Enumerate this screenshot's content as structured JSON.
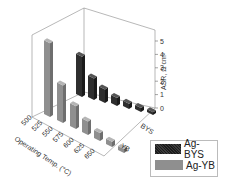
{
  "chart_data": {
    "type": "bar",
    "subtype": "3d-bar",
    "title": "",
    "xlabel": "Operating Temp. (°C)",
    "ylabel": "",
    "zlabel": "ASR, Ω cm²",
    "categories": [
      "500",
      "525",
      "550",
      "575",
      "600",
      "625",
      "650"
    ],
    "depth_categories": [
      "BYS",
      "YB"
    ],
    "zticks": [
      "0",
      "1",
      "2",
      "3",
      "4",
      "5"
    ],
    "zlim": [
      0,
      5.5
    ],
    "series": [
      {
        "name": "Ag-BYS",
        "color": "#2a2a2a",
        "values": [
          3.0,
          1.6,
          1.0,
          0.6,
          0.4,
          0.3,
          0.2
        ]
      },
      {
        "name": "Ag-YB",
        "color": "#8f8f8f",
        "values": [
          5.5,
          2.8,
          1.7,
          1.0,
          0.6,
          0.4,
          0.3
        ]
      }
    ],
    "legend": {
      "position": "bottom-right",
      "entries": [
        "Ag-BYS",
        "Ag-YB"
      ]
    },
    "grid": false
  }
}
